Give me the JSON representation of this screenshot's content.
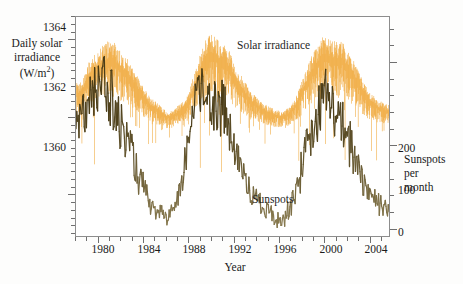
{
  "figure": {
    "background": "#fdfdfc",
    "frame_color": "#8d8d8d"
  },
  "chart_data": {
    "type": "line",
    "title": "",
    "xlabel": "Year",
    "grid": false,
    "legend_position": "inline-annotations",
    "xlim": [
      1978.0,
      2005.8
    ],
    "xticks": [
      1980,
      1984,
      1988,
      1992,
      1996,
      2000,
      2004
    ],
    "xtick_labels": [
      "1980",
      "1984",
      "1988",
      "1992",
      "1996",
      "2000",
      "2004"
    ],
    "xminor_step": 1,
    "axes": [
      {
        "id": "left",
        "label_lines": [
          "Daily solar",
          "irradiance",
          "(W/m2)"
        ],
        "label_text": "Daily solar irradiance (W/m^2)",
        "unit": "W/m2",
        "ylim": [
          1358.9,
          1364.6
        ],
        "yticks": [
          1360,
          1362,
          1364
        ],
        "ytick_labels": [
          "1360",
          "1362",
          "1364"
        ],
        "yminor_step": 0.2
      },
      {
        "id": "right",
        "label_lines": [
          "Sunspots",
          "per",
          "month"
        ],
        "label_text": "Sunspots per month",
        "unit": "sunspots per month",
        "ylim": [
          -10,
          255
        ],
        "yticks": [
          0,
          100,
          200
        ],
        "ytick_labels": [
          "0",
          "100",
          "200"
        ],
        "yminor_step": 20
      }
    ],
    "annotations": [
      {
        "text": "Solar irradiance",
        "x": 1991.6,
        "y_axis": "left",
        "color": "#1f1f1f"
      },
      {
        "text": "Sunspots",
        "x": 1993.0,
        "y_axis": "right",
        "color": "#1f1f1f"
      }
    ],
    "series": [
      {
        "name": "Solar irradiance",
        "axis": "left",
        "color": "#f0a93c",
        "style": "dense-daily-spikes",
        "x": [
          1978.5,
          1979.0,
          1979.5,
          1980.0,
          1980.5,
          1981.0,
          1981.5,
          1982.0,
          1982.5,
          1983.0,
          1983.5,
          1984.0,
          1984.5,
          1985.0,
          1985.5,
          1986.0,
          1986.5,
          1987.0,
          1987.5,
          1988.0,
          1988.5,
          1989.0,
          1989.5,
          1990.0,
          1990.5,
          1991.0,
          1991.5,
          1992.0,
          1992.5,
          1993.0,
          1993.5,
          1994.0,
          1994.5,
          1995.0,
          1995.5,
          1996.0,
          1996.5,
          1997.0,
          1997.5,
          1998.0,
          1998.5,
          1999.0,
          1999.5,
          2000.0,
          2000.5,
          2001.0,
          2001.5,
          2002.0,
          2002.5,
          2003.0,
          2003.5,
          2004.0,
          2004.5,
          2005.0,
          2005.5
        ],
        "values": [
          1362.6,
          1363.0,
          1363.2,
          1363.3,
          1363.4,
          1363.5,
          1363.4,
          1363.2,
          1363.1,
          1362.9,
          1362.7,
          1362.5,
          1362.3,
          1362.2,
          1362.1,
          1362.0,
          1362.0,
          1362.1,
          1362.2,
          1362.4,
          1362.8,
          1363.2,
          1363.5,
          1363.6,
          1363.5,
          1363.4,
          1363.3,
          1363.0,
          1362.8,
          1362.6,
          1362.4,
          1362.3,
          1362.2,
          1362.1,
          1362.05,
          1362.0,
          1362.0,
          1362.1,
          1362.3,
          1362.6,
          1362.9,
          1363.2,
          1363.4,
          1363.6,
          1363.5,
          1363.45,
          1363.5,
          1363.3,
          1363.1,
          1362.9,
          1362.6,
          1362.4,
          1362.3,
          1362.2,
          1362.15
        ],
        "spike_amplitude_down": 1.8,
        "note": "daily values; dense vertical spike envelope with deep downward excursions"
      },
      {
        "name": "Sunspots",
        "axis": "right",
        "color_dark": "#4b3d18",
        "color_light": "#8a7c52",
        "style": "monthly-jagged-line",
        "x": [
          1978.5,
          1979.0,
          1979.5,
          1980.0,
          1980.5,
          1981.0,
          1981.5,
          1982.0,
          1982.5,
          1983.0,
          1983.5,
          1984.0,
          1984.5,
          1985.0,
          1985.5,
          1986.0,
          1986.5,
          1987.0,
          1987.5,
          1988.0,
          1988.5,
          1989.0,
          1989.5,
          1990.0,
          1990.5,
          1991.0,
          1991.5,
          1992.0,
          1992.5,
          1993.0,
          1993.5,
          1994.0,
          1994.5,
          1995.0,
          1995.5,
          1996.0,
          1996.5,
          1997.0,
          1997.5,
          1998.0,
          1998.5,
          1999.0,
          1999.5,
          2000.0,
          2000.5,
          2001.0,
          2001.5,
          2002.0,
          2002.5,
          2003.0,
          2003.5,
          2004.0,
          2004.5,
          2005.0,
          2005.5
        ],
        "values": [
          130,
          165,
          180,
          160,
          175,
          160,
          140,
          120,
          110,
          90,
          65,
          45,
          30,
          20,
          15,
          13,
          18,
          30,
          60,
          110,
          150,
          175,
          165,
          160,
          150,
          145,
          130,
          95,
          80,
          60,
          45,
          35,
          28,
          20,
          16,
          10,
          14,
          25,
          45,
          70,
          95,
          110,
          130,
          175,
          150,
          140,
          130,
          110,
          95,
          80,
          60,
          45,
          38,
          30,
          25
        ],
        "note": "monthly sunspot number; jagged high-frequency noise superposed on 11-year cycle"
      }
    ]
  },
  "accessibility": {
    "description": "Time series of daily total solar irradiance and monthly sunspot number, 1978-2005, showing two full solar cycles in phase."
  }
}
